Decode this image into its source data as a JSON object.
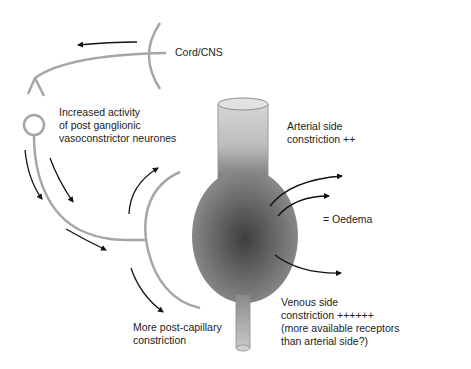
{
  "labels": {
    "cord": "Cord/CNS",
    "increased_activity": "Increased activity\nof post ganglionic\nvasoconstrictor neurones",
    "arterial": "Arterial side\nconstriction ++",
    "oedema": "= Oedema",
    "venous": "Venous side\nconstriction ++++++\n(more available receptors\nthan arterial side?)",
    "post_capillary": "More post-capillary\nconstriction"
  },
  "colors": {
    "nerve": "#a6a6a6",
    "arrow": "#111111",
    "vessel_light": "#cfcfcf",
    "vessel_dark": "#4a4a4a",
    "text": "#222222"
  }
}
